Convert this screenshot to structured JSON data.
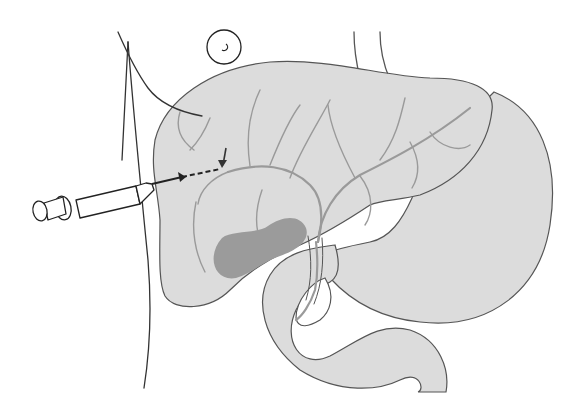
{
  "figure": {
    "description": "Percutaneous transhepatic cholangiography: needle inserted through right flank into intrahepatic bile duct",
    "colors": {
      "organ_fill": "#dcdcdc",
      "duct": "#9a9a9a",
      "gallbladder": "#9b9b9b",
      "outline": "#333333"
    },
    "elements": [
      {
        "id": "body-outline",
        "label": "Body wall outline"
      },
      {
        "id": "navel",
        "label": "Umbilicus"
      },
      {
        "id": "esophagus",
        "label": "Esophagus"
      },
      {
        "id": "liver",
        "label": "Liver"
      },
      {
        "id": "bile-ducts",
        "label": "Intrahepatic bile ducts"
      },
      {
        "id": "gallbladder",
        "label": "Gallbladder"
      },
      {
        "id": "common-bile-duct",
        "label": "Common bile duct"
      },
      {
        "id": "stomach",
        "label": "Stomach"
      },
      {
        "id": "duodenum",
        "label": "Duodenum"
      },
      {
        "id": "needle",
        "label": "Needle"
      },
      {
        "id": "syringe",
        "label": "Syringe"
      },
      {
        "id": "arrow",
        "label": "Arrow pointing to puncture site"
      }
    ]
  }
}
